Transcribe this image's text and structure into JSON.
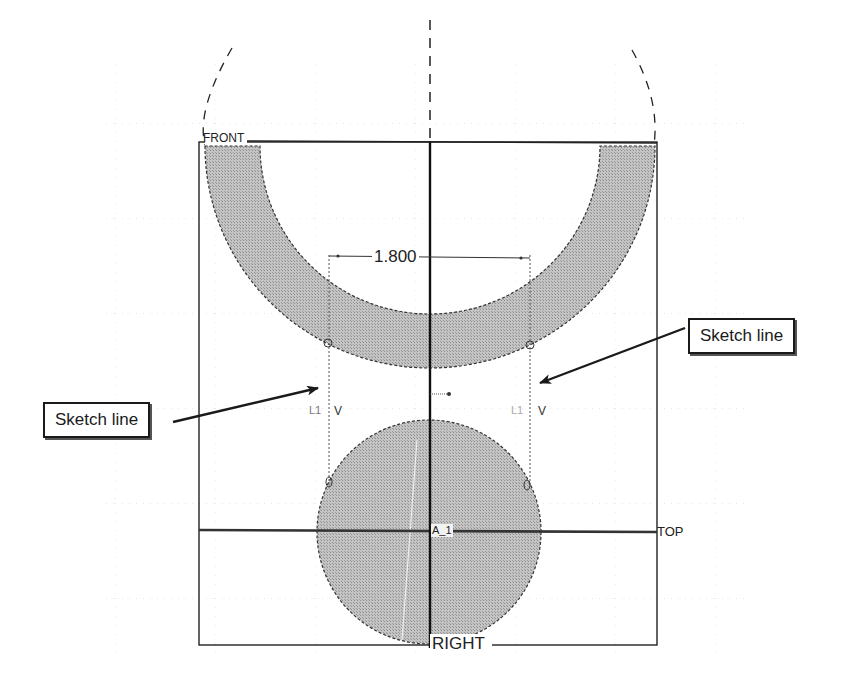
{
  "datum_planes": {
    "front": "FRONT",
    "top": "TOP",
    "right": "RIGHT"
  },
  "axis_label": "A_1",
  "dimension": {
    "value": "1.800"
  },
  "constraints": {
    "left_line": {
      "tag": "L1",
      "symbol": "V"
    },
    "right_line": {
      "tag": "L1",
      "symbol": "V"
    }
  },
  "callouts": [
    {
      "label": "Sketch line",
      "side": "left"
    },
    {
      "label": "Sketch line",
      "side": "right"
    }
  ],
  "colors": {
    "fill": "#b8b8b8",
    "line": "#1a1a1a",
    "grid": "#c8c8c8",
    "background": "#ffffff"
  }
}
